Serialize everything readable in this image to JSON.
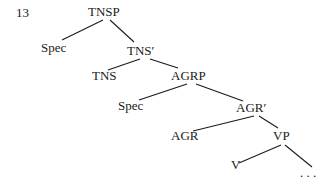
{
  "example_number": "13",
  "tree": {
    "nodes": [
      {
        "id": "tnsp",
        "label": "TNSP",
        "x": 88,
        "y": 4
      },
      {
        "id": "spec1",
        "label": "Spec",
        "x": 41,
        "y": 40
      },
      {
        "id": "tns_bar",
        "label": "TNS′",
        "x": 127,
        "y": 43
      },
      {
        "id": "tns",
        "label": "TNS",
        "x": 92,
        "y": 68
      },
      {
        "id": "agrp",
        "label": "AGRP",
        "x": 171,
        "y": 68
      },
      {
        "id": "spec2",
        "label": "Spec",
        "x": 118,
        "y": 98
      },
      {
        "id": "agr_bar",
        "label": "AGR′",
        "x": 236,
        "y": 100
      },
      {
        "id": "agr",
        "label": "AGR",
        "x": 171,
        "y": 128
      },
      {
        "id": "vp",
        "label": "VP",
        "x": 273,
        "y": 128
      },
      {
        "id": "v",
        "label": "V",
        "x": 231,
        "y": 157
      },
      {
        "id": "ellipsis",
        "label": ". . .",
        "x": 300,
        "y": 165
      }
    ],
    "edges": [
      {
        "x1": 103,
        "y1": 20,
        "x2": 62,
        "y2": 40
      },
      {
        "x1": 110,
        "y1": 20,
        "x2": 134,
        "y2": 42
      },
      {
        "x1": 140,
        "y1": 59,
        "x2": 108,
        "y2": 70
      },
      {
        "x1": 150,
        "y1": 59,
        "x2": 178,
        "y2": 68
      },
      {
        "x1": 187,
        "y1": 84,
        "x2": 139,
        "y2": 100
      },
      {
        "x1": 196,
        "y1": 84,
        "x2": 243,
        "y2": 101
      },
      {
        "x1": 254,
        "y1": 116,
        "x2": 193,
        "y2": 131
      },
      {
        "x1": 259,
        "y1": 116,
        "x2": 278,
        "y2": 128
      },
      {
        "x1": 281,
        "y1": 145,
        "x2": 239,
        "y2": 163
      },
      {
        "x1": 285,
        "y1": 145,
        "x2": 312,
        "y2": 167
      }
    ]
  }
}
